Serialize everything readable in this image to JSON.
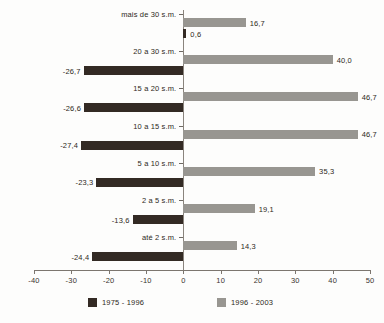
{
  "chart_data": {
    "type": "bar",
    "orientation": "horizontal",
    "title": "",
    "xlabel": "",
    "ylabel": "",
    "xlim": [
      -40,
      50
    ],
    "xticks": [
      -40,
      -30,
      -20,
      -10,
      0,
      10,
      20,
      30,
      40,
      50
    ],
    "xtick_labels": [
      "-40",
      "-30",
      "-20",
      "-10",
      "0",
      "10",
      "20",
      "30",
      "40",
      "50"
    ],
    "grid": false,
    "legend_position": "bottom",
    "categories": [
      "mais de 30 s.m.",
      "20 a 30 s.m.",
      "15 a 20 s.m.",
      "10 a 15 s.m.",
      "5 a 10 s.m.",
      "2 a 5 s.m.",
      "até 2 s.m."
    ],
    "series": [
      {
        "name": "1975 - 1996",
        "color": "#332a24",
        "values": [
          0.6,
          -26.7,
          -26.6,
          -27.4,
          -23.3,
          -13.6,
          -24.4
        ],
        "labels": [
          "0,6",
          "-26,7",
          "-26,6",
          "-27,4",
          "-23,3",
          "-13,6",
          "-24,4"
        ]
      },
      {
        "name": "1996 - 2003",
        "color": "#989691",
        "values": [
          16.7,
          40.0,
          46.7,
          46.7,
          35.3,
          19.1,
          14.3
        ],
        "labels": [
          "16,7",
          "40,0",
          "46,7",
          "46,7",
          "35,3",
          "19,1",
          "14,3"
        ]
      }
    ]
  },
  "legend": {
    "items": [
      {
        "label": "1975 - 1996",
        "swatch": "dark"
      },
      {
        "label": "1996 - 2003",
        "swatch": "gray"
      }
    ]
  }
}
